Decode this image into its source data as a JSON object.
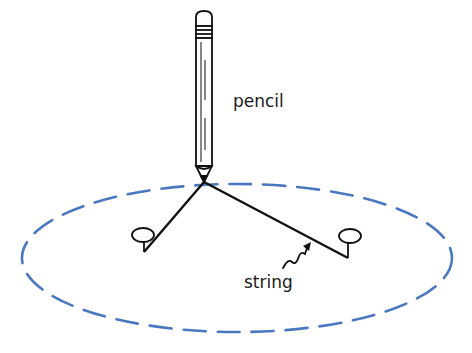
{
  "diagram": {
    "labels": {
      "pencil": "pencil",
      "string": "string"
    },
    "colors": {
      "ellipse": "#4a78c0",
      "ink": "#111111",
      "background": "#ffffff"
    },
    "ellipse": {
      "cx": 237,
      "cy": 258,
      "rx": 215,
      "ry": 74,
      "style": "dashed"
    },
    "pencil_tip": {
      "x": 204,
      "y": 183
    },
    "pins": [
      {
        "name": "left-focus",
        "head": {
          "x": 144,
          "y": 233
        },
        "base": {
          "x": 144,
          "y": 252
        }
      },
      {
        "name": "right-focus",
        "head": {
          "x": 350,
          "y": 236
        },
        "base": {
          "x": 348,
          "y": 258
        }
      }
    ]
  }
}
